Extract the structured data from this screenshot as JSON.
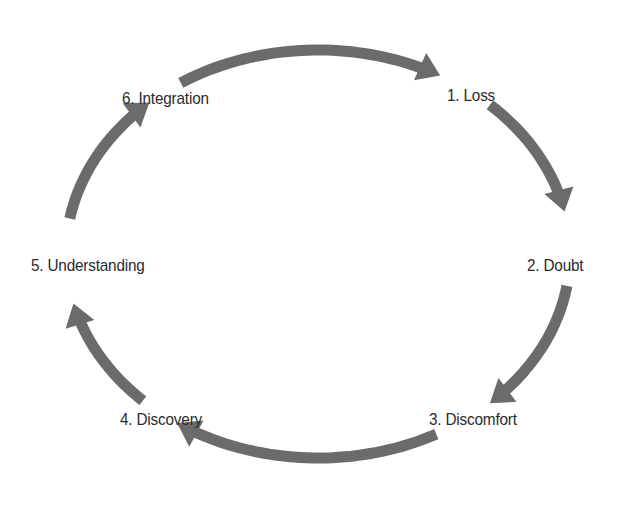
{
  "diagram": {
    "type": "cycle",
    "direction": "clockwise",
    "arrow_color": "#6b6b6b",
    "text_color": "#2b2b2b",
    "stages": [
      {
        "id": "loss",
        "label": "1. Loss"
      },
      {
        "id": "doubt",
        "label": "2. Doubt"
      },
      {
        "id": "discomfort",
        "label": "3. Discomfort"
      },
      {
        "id": "discovery",
        "label": "4. Discovery"
      },
      {
        "id": "understanding",
        "label": "5. Understanding"
      },
      {
        "id": "integration",
        "label": "6. Integration"
      }
    ],
    "connections": [
      {
        "from": "integration",
        "to": "loss"
      },
      {
        "from": "loss",
        "to": "doubt"
      },
      {
        "from": "doubt",
        "to": "discomfort"
      },
      {
        "from": "discomfort",
        "to": "discovery"
      },
      {
        "from": "discovery",
        "to": "understanding"
      },
      {
        "from": "understanding",
        "to": "integration"
      }
    ]
  }
}
